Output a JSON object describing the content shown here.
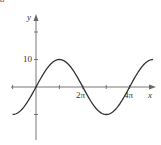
{
  "panel_label": "a",
  "chart_data": {
    "type": "line",
    "title": "",
    "function": "y = 10 sin(x/2)",
    "xlabel": "x",
    "ylabel": "y",
    "x_tick_labels": [
      "2π",
      "4π"
    ],
    "y_tick_labels": [
      "10"
    ],
    "x_ticks": [
      -3.1416,
      0,
      3.1416,
      6.2832,
      9.4248,
      12.5664
    ],
    "y_ticks": [
      -10,
      0,
      10,
      20
    ],
    "xlim": [
      -3.1416,
      15.708
    ],
    "ylim": [
      -20,
      26
    ],
    "grid": false,
    "legend": null,
    "series": [
      {
        "name": "curve",
        "x": [
          -3.1416,
          -1.5708,
          0,
          1.5708,
          3.1416,
          4.7124,
          6.2832,
          7.854,
          9.4248,
          10.9956,
          12.5664,
          14.1372,
          15.708
        ],
        "y": [
          -10,
          -7.07,
          0,
          7.07,
          10,
          7.07,
          0,
          -7.07,
          -10,
          -7.07,
          0,
          7.07,
          10
        ]
      }
    ]
  },
  "colors": {
    "axis": "#666666",
    "curve": "#333333"
  }
}
